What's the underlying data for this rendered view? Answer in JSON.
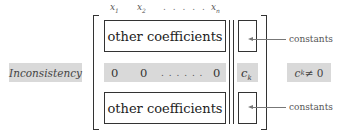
{
  "column_headers": {
    "x1": {
      "base": "x",
      "sub": "1"
    },
    "x2": {
      "base": "x",
      "sub": "2"
    },
    "dots": ". . . . .",
    "xn": {
      "base": "x",
      "sub": "n"
    }
  },
  "matrix": {
    "top_block_label": "other coefficients",
    "bottom_block_label": "other coefficients",
    "inconsistent_row": {
      "entries": [
        "0",
        "0",
        ". . . . . .",
        "0"
      ],
      "constant": {
        "base": "c",
        "sub": "k"
      }
    }
  },
  "annotations": {
    "left_label": "Inconsistency",
    "right_label": {
      "base": "c",
      "sub": "k",
      "rest": " ≠ 0"
    },
    "constants_top": "constants",
    "constants_bottom": "constants"
  },
  "colors": {
    "highlight_gray": "#d9d9d9",
    "line": "#333333",
    "arrow": "#777777"
  }
}
